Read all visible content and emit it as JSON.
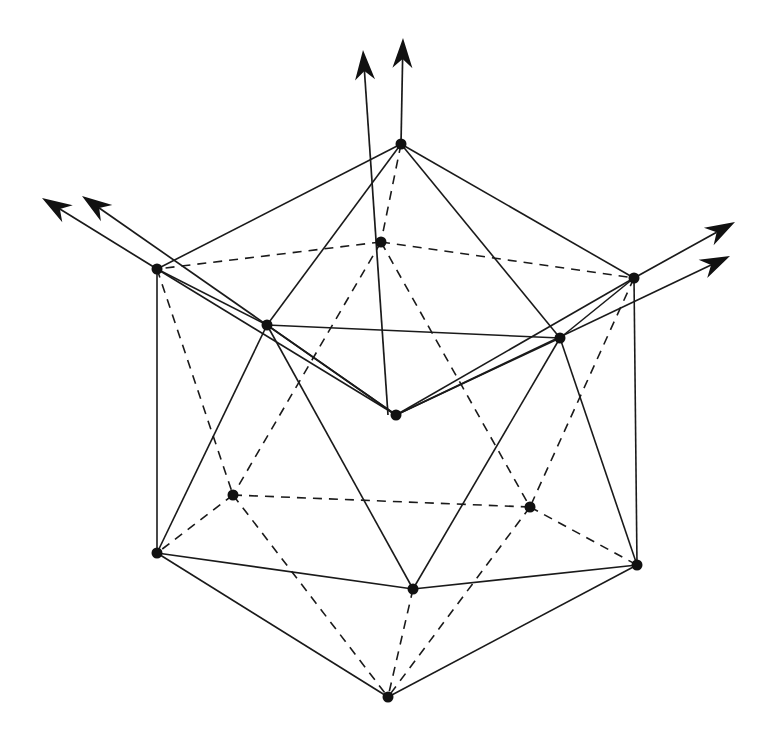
{
  "diagram": {
    "type": "icosahedron-with-vectors",
    "colors": {
      "line": "#1a1a1a",
      "vertex": "#111111",
      "background": "#ffffff"
    },
    "vertices": {
      "T": [
        401,
        144
      ],
      "B": [
        381,
        242
      ],
      "L": [
        157,
        269
      ],
      "R": [
        634,
        278
      ],
      "FL": [
        267,
        325
      ],
      "FR": [
        560,
        338
      ],
      "C": [
        396,
        415
      ],
      "BL": [
        233,
        495
      ],
      "BR": [
        530,
        507
      ],
      "LL": [
        157,
        553
      ],
      "RL": [
        637,
        565
      ],
      "F": [
        413,
        589
      ],
      "Bot": [
        388,
        697
      ]
    },
    "solid_edges": [
      [
        "T",
        "L"
      ],
      [
        "T",
        "R"
      ],
      [
        "T",
        "FL"
      ],
      [
        "T",
        "FR"
      ],
      [
        "L",
        "FL"
      ],
      [
        "R",
        "FR"
      ],
      [
        "FL",
        "FR"
      ],
      [
        "L",
        "LL"
      ],
      [
        "R",
        "RL"
      ],
      [
        "FL",
        "LL"
      ],
      [
        "FL",
        "F"
      ],
      [
        "FR",
        "F"
      ],
      [
        "FR",
        "RL"
      ],
      [
        "LL",
        "F"
      ],
      [
        "F",
        "RL"
      ],
      [
        "LL",
        "Bot"
      ],
      [
        "RL",
        "Bot"
      ],
      [
        "FL",
        "C"
      ],
      [
        "FR",
        "C"
      ],
      [
        "L",
        "C"
      ],
      [
        "R",
        "C"
      ]
    ],
    "dashed_edges": [
      [
        "T",
        "B"
      ],
      [
        "B",
        "L"
      ],
      [
        "B",
        "R"
      ],
      [
        "B",
        "BL"
      ],
      [
        "B",
        "BR"
      ],
      [
        "L",
        "BL"
      ],
      [
        "R",
        "BR"
      ],
      [
        "BL",
        "BR"
      ],
      [
        "BL",
        "LL"
      ],
      [
        "BR",
        "RL"
      ],
      [
        "BL",
        "Bot"
      ],
      [
        "BR",
        "Bot"
      ],
      [
        "F",
        "Bot"
      ]
    ],
    "arrows": [
      {
        "name": "arrow-up-left",
        "from": [
          388,
          415
        ],
        "to": [
          363,
          50
        ]
      },
      {
        "name": "arrow-up-right",
        "from": [
          401,
          144
        ],
        "to": [
          403,
          38
        ]
      },
      {
        "name": "arrow-left-outer",
        "from": [
          157,
          269
        ],
        "to": [
          42,
          198
        ]
      },
      {
        "name": "arrow-left-inner",
        "from": [
          396,
          415
        ],
        "to": [
          82,
          196
        ]
      },
      {
        "name": "arrow-right-outer",
        "from": [
          634,
          278
        ],
        "to": [
          735,
          222
        ]
      },
      {
        "name": "arrow-right-inner",
        "from": [
          396,
          415
        ],
        "to": [
          730,
          256
        ]
      }
    ]
  }
}
